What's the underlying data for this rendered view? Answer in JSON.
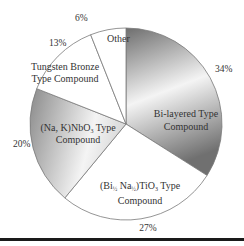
{
  "chart_data": {
    "type": "pie",
    "title": "",
    "start_angle_deg": 0,
    "direction": "clockwise",
    "slices": [
      {
        "label_lines": [
          "Bi-layered Type",
          "Compound"
        ],
        "value": 34,
        "value_label": "34%",
        "fill": "gradient",
        "gradient": [
          "#6e6e6e",
          "#f2f2f2"
        ]
      },
      {
        "label_lines": [
          "(Bi½ Na½)TiO₃ Type",
          "Compound"
        ],
        "value": 27,
        "value_label": "27%",
        "fill": "#ffffff"
      },
      {
        "label_lines": [
          "(Na, K)NbO₃ Type",
          "Compound"
        ],
        "value": 20,
        "value_label": "20%",
        "fill": "gradient",
        "gradient": [
          "#8a8a8a",
          "#f4f4f4"
        ]
      },
      {
        "label_lines": [
          "Tungsten Bronze",
          "Type Compound"
        ],
        "value": 13,
        "value_label": "13%",
        "fill": "#ffffff"
      },
      {
        "label_lines": [
          "Other"
        ],
        "value": 6,
        "value_label": "6%",
        "fill": "#ffffff"
      }
    ],
    "categories": [
      "Bi-layered Type Compound",
      "(Bi½ Na½)TiO₃ Type Compound",
      "(Na, K)NbO₃ Type Compound",
      "Tungsten Bronze Type Compound",
      "Other"
    ],
    "values": [
      34,
      27,
      20,
      13,
      6
    ],
    "unit": "%",
    "legend": "none (labels inside slices)"
  },
  "labels": {
    "bi_layered": [
      "Bi-layered Type",
      "Compound"
    ],
    "bnt": [
      "(Bi",
      "½",
      " Na",
      "½",
      ")TiO",
      "3",
      " Type",
      "Compound"
    ],
    "knn": [
      "(Na, K)NbO",
      "3",
      " Type",
      "Compound"
    ],
    "tungsten": [
      "Tungsten Bronze",
      "Type Compound"
    ],
    "other": "Other",
    "pct_bi_layered": "34%",
    "pct_bnt": "27%",
    "pct_knn": "20%",
    "pct_tungsten": "13%",
    "pct_other": "6%"
  },
  "colors": {
    "outline": "#7a7a7a",
    "rule": "#1a1a1a",
    "text": "#333333"
  }
}
